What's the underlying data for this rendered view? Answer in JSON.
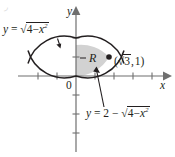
{
  "figure": {
    "type": "cartesian-plot",
    "background_color": "#ffffff",
    "ink_color": "#231f20",
    "shade_color": "#d2d2d2",
    "axes": {
      "x_label": "x",
      "y_label": "y",
      "origin_label": "0",
      "origin_px": {
        "x": 76,
        "y": 76
      },
      "unit_px": 19,
      "x_range": [
        -3,
        5
      ],
      "y_range": [
        -4,
        3
      ],
      "x_ticks": [
        -2,
        -1,
        1,
        2,
        3,
        4
      ],
      "y_ticks": [
        -3,
        -2,
        -1,
        1,
        2
      ],
      "x_arrow": "right",
      "y_arrow": "up",
      "grid": false
    },
    "curves": [
      {
        "id": "upper-semicircle",
        "expression": "y = sqrt(4 - x^2)",
        "label": "y = √(4 − x²)",
        "center": [
          0,
          0
        ],
        "radius": 2,
        "branch": "upper"
      },
      {
        "id": "lower-shifted-semicircle",
        "expression": "y = 2 - sqrt(4 - x^2)",
        "label": "y = 2 − √(4 − x²)",
        "center": [
          0,
          2
        ],
        "radius": 2,
        "branch": "lower"
      }
    ],
    "region": {
      "label": "R",
      "description": "lens-shaped region between the two circular arcs",
      "shaded_half": "right",
      "shade_color": "#d2d2d2"
    },
    "points": [
      {
        "label": "(√3, 1)",
        "x": 1.7320508,
        "y": 1,
        "marker": "filled-dot"
      }
    ],
    "annotations": [
      {
        "id": "leader-upper",
        "from": "label-upper-curve",
        "to": "upper-semicircle",
        "style": "short-arrow"
      },
      {
        "id": "leader-lower",
        "from": "label-lower-curve",
        "to": "intersection-point",
        "style": "long-arrow"
      }
    ]
  },
  "labels": {
    "upper_curve": {
      "lhs": "y",
      "eq": "=",
      "radicand_a": "4",
      "minus": "−",
      "radicand_b": "x",
      "exponent": "2"
    },
    "lower_curve": {
      "lhs": "y",
      "eq": "=",
      "const": "2",
      "minus_outer": "−",
      "radicand_a": "4",
      "minus_inner": "−",
      "radicand_b": "x",
      "exponent": "2"
    },
    "point": {
      "open": "(",
      "radicand": "3",
      "comma": ",",
      "yvalue": "1",
      "close": ")"
    },
    "region": "R",
    "origin": "0",
    "axis_x": "x",
    "axis_y": "y",
    "corner_artifact": "◞"
  }
}
